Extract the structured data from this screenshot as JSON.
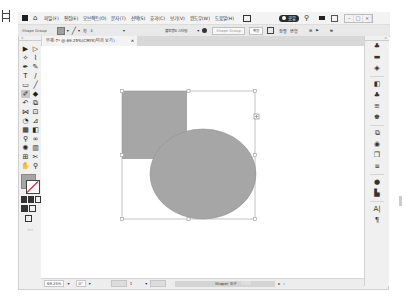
{
  "menubar": {
    "items": [
      "파일(F)",
      "편집(E)",
      "오브젝트(O)",
      "문자(T)",
      "선택(S)",
      "효과(C)",
      "보기(V)",
      "윈도우(W)",
      "도움말(H)"
    ],
    "share_label": "공유",
    "window_controls": [
      "–",
      "□",
      "×"
    ]
  },
  "control_bar": {
    "selection_label": "Shape Group",
    "stroke_weight": "",
    "opacity_label": "불투명도 스타일",
    "style_field": "Shape Group",
    "transform_label": "확장",
    "align_label": "정렬",
    "shape_label": "변형"
  },
  "document_tab": {
    "title": "무제-7* @ 69.25%(CMYK/미리 보기)",
    "close": "×"
  },
  "toolbar": {
    "tools": [
      {
        "name": "selection-tool",
        "glyph": "▶"
      },
      {
        "name": "direct-selection-tool",
        "glyph": "▷"
      },
      {
        "name": "magic-wand-tool",
        "glyph": "✧"
      },
      {
        "name": "lasso-tool",
        "glyph": "⌇"
      },
      {
        "name": "pen-tool",
        "glyph": "✒"
      },
      {
        "name": "curvature-tool",
        "glyph": "✎"
      },
      {
        "name": "type-tool",
        "glyph": "T"
      },
      {
        "name": "line-tool",
        "glyph": "/"
      },
      {
        "name": "rectangle-tool",
        "glyph": "▭"
      },
      {
        "name": "paintbrush-tool",
        "glyph": "╱"
      },
      {
        "name": "shaper-tool",
        "glyph": "✐",
        "selected": true
      },
      {
        "name": "eraser-tool",
        "glyph": "◆"
      },
      {
        "name": "rotate-tool",
        "glyph": "↶"
      },
      {
        "name": "scale-tool",
        "glyph": "⧉"
      },
      {
        "name": "width-tool",
        "glyph": "⋈"
      },
      {
        "name": "free-transform-tool",
        "glyph": "⊡"
      },
      {
        "name": "shape-builder-tool",
        "glyph": "◔"
      },
      {
        "name": "perspective-tool",
        "glyph": "⊿"
      },
      {
        "name": "mesh-tool",
        "glyph": "▦"
      },
      {
        "name": "gradient-tool",
        "glyph": "◧"
      },
      {
        "name": "eyedropper-tool",
        "glyph": "⚲"
      },
      {
        "name": "blend-tool",
        "glyph": "∞"
      },
      {
        "name": "symbol-sprayer-tool",
        "glyph": "✺"
      },
      {
        "name": "graph-tool",
        "glyph": "▥"
      },
      {
        "name": "artboard-tool",
        "glyph": "⊞"
      },
      {
        "name": "slice-tool",
        "glyph": "✂"
      },
      {
        "name": "hand-tool",
        "glyph": "✋"
      },
      {
        "name": "zoom-tool",
        "glyph": "⚲"
      }
    ],
    "more": "···"
  },
  "right_panel": {
    "icons": [
      "properties-icon",
      "libraries-icon",
      "layers-icon",
      "swatches-icon",
      "color-icon",
      "stroke-icon",
      "symbols-icon",
      "brushes-icon",
      "appearance-icon",
      "artboards-icon",
      "transform-icon",
      "pathfinder-icon",
      "align-icon",
      "character-icon",
      "paragraph-icon"
    ]
  },
  "canvas": {
    "shape_fill": "#a6a6a6",
    "shape_stroke": "#8f8f8f",
    "selection_color": "#9a9a9a"
  },
  "statusbar": {
    "zoom": "69.25%",
    "rotation": "0°",
    "artboard_nav": "1",
    "tool_name": "Shaper 도구"
  }
}
